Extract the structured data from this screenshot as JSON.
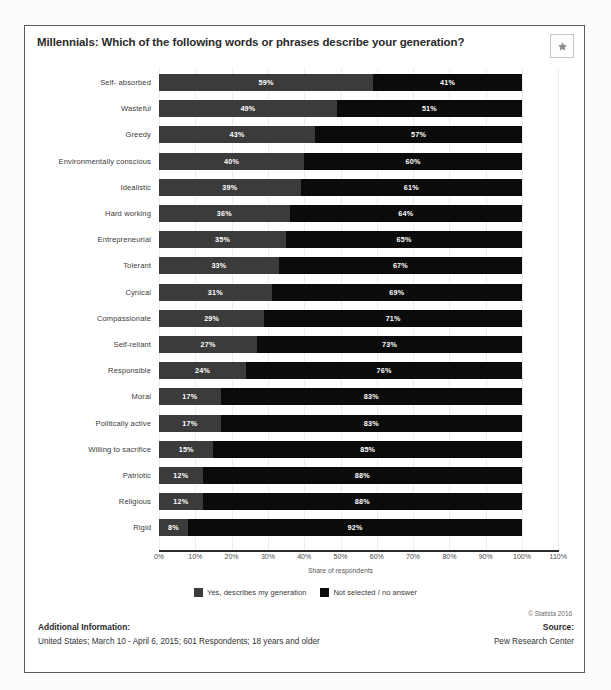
{
  "header": {
    "title": "Millennials: Which of the following words or phrases describe your generation?",
    "favorite_icon": "star-icon"
  },
  "footer": {
    "additional_info_heading": "Additional Information:",
    "additional_info_body": "United States; March 10 - April 6, 2015; 601 Respondents; 18 years and older",
    "source_heading": "Source:",
    "source_body": "Pew Research Center",
    "copyright": "© Statista 2016"
  },
  "chart_data": {
    "type": "bar",
    "orientation": "horizontal",
    "stacked": true,
    "title": "Millennials: Which of the following words or phrases describe your generation?",
    "xlabel": "Share of respondents",
    "ylabel": "",
    "xlim": [
      0,
      110
    ],
    "grid": true,
    "legend_position": "bottom",
    "tick_labels": [
      "0%",
      "10%",
      "20%",
      "30%",
      "40%",
      "50%",
      "60%",
      "70%",
      "80%",
      "90%",
      "100%",
      "110%"
    ],
    "tick_values": [
      0,
      10,
      20,
      30,
      40,
      50,
      60,
      70,
      80,
      90,
      100,
      110
    ],
    "categories": [
      "Self- absorbed",
      "Wasteful",
      "Greedy",
      "Environmentally conscious",
      "Idealistic",
      "Hard working",
      "Entrepreneurial",
      "Tolerant",
      "Cynical",
      "Compassionate",
      "Self-reliant",
      "Responsible",
      "Moral",
      "Politically active",
      "Willing to sacrifice",
      "Patriotic",
      "Religious",
      "Rigid"
    ],
    "series": [
      {
        "name": "Yes, describes my generation",
        "color": "#3b3b3b",
        "values": [
          59,
          49,
          43,
          40,
          39,
          36,
          35,
          33,
          31,
          29,
          27,
          24,
          17,
          17,
          15,
          12,
          12,
          8
        ],
        "labels": [
          "59%",
          "49%",
          "43%",
          "40%",
          "39%",
          "36%",
          "35%",
          "33%",
          "31%",
          "29%",
          "27%",
          "24%",
          "17%",
          "17%",
          "15%",
          "12%",
          "12%",
          "8%"
        ]
      },
      {
        "name": "Not selected / no answer",
        "color": "#0b0b0b",
        "values": [
          41,
          51,
          57,
          60,
          61,
          64,
          65,
          67,
          69,
          71,
          73,
          76,
          83,
          83,
          85,
          88,
          88,
          92
        ],
        "labels": [
          "41%",
          "51%",
          "57%",
          "60%",
          "61%",
          "64%",
          "65%",
          "67%",
          "69%",
          "71%",
          "73%",
          "76%",
          "83%",
          "83%",
          "85%",
          "88%",
          "88%",
          "92%"
        ]
      }
    ]
  }
}
